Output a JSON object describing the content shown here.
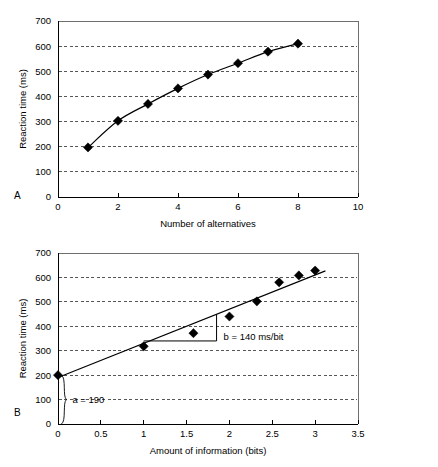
{
  "figure": {
    "panels": [
      {
        "letter": "A",
        "letter_name": "panel-label-a"
      },
      {
        "letter": "B",
        "letter_name": "panel-label-b"
      }
    ]
  },
  "chart_data": [
    {
      "type": "line",
      "panel": "A",
      "title": "",
      "xlabel": "Number of alternatives",
      "ylabel": "Reaction time (ms)",
      "xlim": [
        0,
        10
      ],
      "ylim": [
        0,
        700
      ],
      "xticks": [
        0,
        2,
        4,
        6,
        8,
        10
      ],
      "xticklabels": [
        "0",
        "2",
        "4",
        "6",
        "8",
        "10"
      ],
      "yticks": [
        0,
        100,
        200,
        300,
        400,
        500,
        600,
        700
      ],
      "yticklabels": [
        "0",
        "100",
        "200",
        "300",
        "400",
        "500",
        "600",
        "700"
      ],
      "grid": "horizontal-dashed",
      "legend": "none",
      "marker": "diamond",
      "x": [
        1,
        2,
        3,
        4,
        5,
        6,
        7,
        8
      ],
      "values": [
        197,
        303,
        370,
        432,
        487,
        532,
        578,
        610
      ],
      "annotations": []
    },
    {
      "type": "scatter",
      "panel": "B",
      "title": "",
      "xlabel": "Amount of information (bits)",
      "ylabel": "Reaction time (ms)",
      "xlim": [
        0,
        3.5
      ],
      "ylim": [
        0,
        700
      ],
      "xticks": [
        0,
        0.5,
        1,
        1.5,
        2,
        2.5,
        3,
        3.5
      ],
      "xticklabels": [
        "0",
        "0.5",
        "1",
        "1.5",
        "2",
        "2.5",
        "3",
        "3.5"
      ],
      "yticks": [
        0,
        100,
        200,
        300,
        400,
        500,
        600,
        700
      ],
      "yticklabels": [
        "0",
        "100",
        "200",
        "300",
        "400",
        "500",
        "600",
        "700"
      ],
      "grid": "horizontal-dashed",
      "legend": "none",
      "marker": "diamond",
      "x": [
        0,
        1,
        1.58,
        2,
        2.32,
        2.58,
        2.81,
        3
      ],
      "values": [
        200,
        318,
        372,
        440,
        502,
        580,
        608,
        628
      ],
      "fit_line": {
        "intercept": 190,
        "slope": 140,
        "x_start": 0,
        "x_end": 3.12
      },
      "annotations": [
        {
          "name": "slope-annotation",
          "text": "b = 140 ms/bit",
          "kind": "slope-triangle",
          "tri_x0": 1.0,
          "tri_x1": 1.85,
          "tri_y_base": 340
        },
        {
          "name": "intercept-annotation",
          "text": "a = 190",
          "kind": "brace",
          "brace_x": 0.04,
          "brace_y0": 0,
          "brace_y1": 200
        }
      ]
    }
  ]
}
